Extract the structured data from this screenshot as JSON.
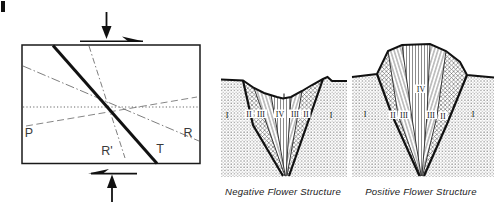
{
  "figure": {
    "strain_box": {
      "labels": {
        "p": "P",
        "r": "R",
        "r_prime": "R'",
        "t": "T"
      }
    },
    "negative_flower": {
      "caption": "Negative Flower Structure",
      "zones": [
        "I",
        "II",
        "III",
        "IV",
        "III",
        "II",
        "I"
      ]
    },
    "positive_flower": {
      "caption": "Positive Flower Structure",
      "zones": [
        "I",
        "II",
        "III",
        "IV",
        "III",
        "II",
        "I"
      ]
    },
    "colors": {
      "ink": "#1a1a1a",
      "line_gray": "#6f6f6f",
      "hatch_gray": "#5f5f5f",
      "stipple_gray": "#8f8f8f",
      "background": "#ffffff"
    }
  }
}
